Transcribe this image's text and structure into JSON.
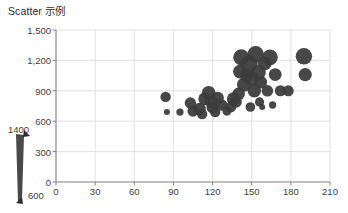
{
  "chart_data": {
    "type": "scatter",
    "title": "Scatter 示例",
    "xlabel": "",
    "ylabel": "",
    "xlim": [
      0,
      210
    ],
    "ylim": [
      0,
      1500
    ],
    "xticks": [
      0,
      30,
      60,
      90,
      120,
      150,
      180,
      210
    ],
    "yticks": [
      0,
      300,
      600,
      900,
      1200,
      1500
    ],
    "ytick_labels": [
      "0",
      "300",
      "600",
      "900",
      "1,200",
      "1,500"
    ],
    "xtick_labels": [
      "0",
      "30",
      "60",
      "90",
      "120",
      "150",
      "180",
      "210"
    ],
    "grid": true,
    "legend": {
      "position": "left-outside",
      "kind": "bubble-size-wedge",
      "max_label": "1400",
      "min_label": "600",
      "max_value": 1400,
      "min_value": 600
    },
    "marker_color": "#3b3b3b",
    "size_field": "size",
    "points": [
      {
        "x": 84,
        "y": 840,
        "size": 760
      },
      {
        "x": 85,
        "y": 690,
        "size": 640
      },
      {
        "x": 95,
        "y": 690,
        "size": 650
      },
      {
        "x": 103,
        "y": 780,
        "size": 820
      },
      {
        "x": 105,
        "y": 700,
        "size": 800
      },
      {
        "x": 110,
        "y": 720,
        "size": 900
      },
      {
        "x": 112,
        "y": 670,
        "size": 760
      },
      {
        "x": 114,
        "y": 820,
        "size": 930
      },
      {
        "x": 117,
        "y": 880,
        "size": 1010
      },
      {
        "x": 119,
        "y": 790,
        "size": 900
      },
      {
        "x": 120,
        "y": 735,
        "size": 860
      },
      {
        "x": 122,
        "y": 690,
        "size": 760
      },
      {
        "x": 124,
        "y": 830,
        "size": 870
      },
      {
        "x": 127,
        "y": 760,
        "size": 820
      },
      {
        "x": 131,
        "y": 700,
        "size": 700
      },
      {
        "x": 134,
        "y": 740,
        "size": 780
      },
      {
        "x": 136,
        "y": 820,
        "size": 950
      },
      {
        "x": 138,
        "y": 790,
        "size": 830
      },
      {
        "x": 140,
        "y": 870,
        "size": 900
      },
      {
        "x": 141,
        "y": 1090,
        "size": 1010
      },
      {
        "x": 142,
        "y": 1230,
        "size": 1260
      },
      {
        "x": 144,
        "y": 960,
        "size": 1020
      },
      {
        "x": 146,
        "y": 1050,
        "size": 950
      },
      {
        "x": 148,
        "y": 1165,
        "size": 1400
      },
      {
        "x": 149,
        "y": 740,
        "size": 720
      },
      {
        "x": 150,
        "y": 1020,
        "size": 1080
      },
      {
        "x": 152,
        "y": 900,
        "size": 980
      },
      {
        "x": 153,
        "y": 1260,
        "size": 1300
      },
      {
        "x": 155,
        "y": 1080,
        "size": 1130
      },
      {
        "x": 156,
        "y": 790,
        "size": 700
      },
      {
        "x": 157,
        "y": 985,
        "size": 900
      },
      {
        "x": 158,
        "y": 740,
        "size": 640
      },
      {
        "x": 160,
        "y": 1170,
        "size": 1000
      },
      {
        "x": 162,
        "y": 900,
        "size": 830
      },
      {
        "x": 164,
        "y": 1230,
        "size": 1200
      },
      {
        "x": 166,
        "y": 760,
        "size": 650
      },
      {
        "x": 168,
        "y": 1060,
        "size": 920
      },
      {
        "x": 172,
        "y": 900,
        "size": 800
      },
      {
        "x": 178,
        "y": 900,
        "size": 790
      },
      {
        "x": 190,
        "y": 1240,
        "size": 1310
      },
      {
        "x": 191,
        "y": 1060,
        "size": 960
      }
    ]
  },
  "axes": {
    "y_axis_color": "#808080",
    "x_axis_color": "#808080",
    "grid_color": "#d9d9d9"
  }
}
